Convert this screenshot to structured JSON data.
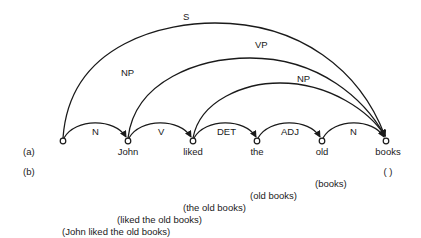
{
  "diagram": {
    "row_labels": {
      "a": "(a)",
      "b": "(b)"
    },
    "nodes": [
      {
        "id": "n0",
        "word": ""
      },
      {
        "id": "n1",
        "word": "John"
      },
      {
        "id": "n2",
        "word": "liked"
      },
      {
        "id": "n3",
        "word": "the"
      },
      {
        "id": "n4",
        "word": "old"
      },
      {
        "id": "n5",
        "word": "books"
      }
    ],
    "edges": [
      {
        "from": "n0",
        "to": "n1",
        "label": "N"
      },
      {
        "from": "n1",
        "to": "n2",
        "label": "V"
      },
      {
        "from": "n2",
        "to": "n3",
        "label": "DET"
      },
      {
        "from": "n3",
        "to": "n4",
        "label": "ADJ"
      },
      {
        "from": "n4",
        "to": "n5",
        "label": "N"
      },
      {
        "from": "n0",
        "to": "n5",
        "label": "S"
      },
      {
        "from": "n1",
        "to": "n5",
        "label": "VP"
      },
      {
        "from": "n2",
        "to": "n5",
        "label": "NP"
      }
    ],
    "extra_labels": {
      "np_left": "NP"
    },
    "remainders": [
      "( )",
      "(books)",
      "(old books)",
      "(the old books)",
      "(liked the old books)",
      "(John liked the old books)"
    ]
  }
}
